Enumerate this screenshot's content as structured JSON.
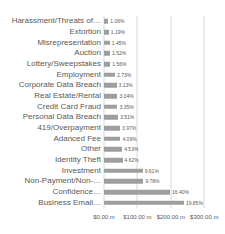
{
  "chart_data": {
    "type": "bar",
    "orientation": "horizontal",
    "title": "",
    "categories": [
      "Harassment/Threats of…",
      "Extortion",
      "Misrepresentation",
      "Auction",
      "Lottery/Sweepstakes",
      "Employment",
      "Corporate Data Breach",
      "Real Estate/Rental",
      "Credit Card Fraud",
      "Personal Data Breach",
      "419/Overpayment",
      "Adanced Fee",
      "Other",
      "Identity Theft",
      "Investment",
      "Non-Payment/Non-…",
      "Confidence…",
      "Business Email…"
    ],
    "percent_labels": [
      "1.06%",
      "1.19%",
      "1.45%",
      "1.52%",
      "1.56%",
      "2.73%",
      "3.13%",
      "3.34%",
      "3.35%",
      "3.51%",
      "3.97%",
      "4.09%",
      "4.53%",
      "4.62%",
      "9.61%",
      "9.78%",
      "16.40%",
      "19.85%"
    ],
    "values_usd_m": [
      12.8,
      14.3,
      17.5,
      18.3,
      18.8,
      32.9,
      37.7,
      40.2,
      40.3,
      42.3,
      47.8,
      49.2,
      54.5,
      55.6,
      115.7,
      117.8,
      197.5,
      239.0
    ],
    "x_axis": {
      "tick_labels": [
        "$0.00 m",
        "$100.00 m",
        "$200.00 m",
        "$300.00 m"
      ],
      "tick_values_m": [
        0,
        100,
        200,
        300
      ],
      "xlim_m": [
        0,
        350
      ],
      "unit": "USD millions"
    },
    "ylabel": "",
    "xlabel": "",
    "legend": null,
    "grid": "vertical",
    "colors": {
      "bar": "#9e9e9e",
      "text": "#595959",
      "gridline": "#d9d9d9",
      "background": "#ffffff"
    }
  }
}
